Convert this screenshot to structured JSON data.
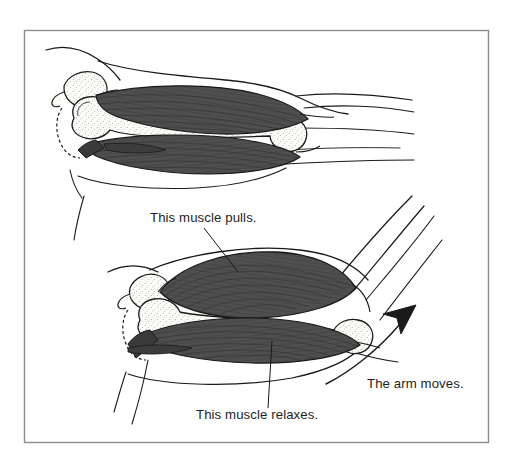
{
  "figure": {
    "domain": "anatomy-illustration",
    "title_visible": false,
    "background_color": "#ffffff",
    "frame": {
      "border_color": "#8a8a8a",
      "border_width_px": 1.5,
      "x": 24,
      "y": 30,
      "width": 465,
      "height": 413
    },
    "ink_color": "#1a1a1a",
    "muscle_fill_color": "#4f4f4f",
    "muscle_shade_dark": "#3a3a3a",
    "bone_fill_color": "#fbfbf8",
    "bone_stipple_color": "#555555",
    "skin_fill_color": "#ffffff"
  },
  "panels": [
    {
      "name": "upper-arm-extended",
      "description": "Arm extended, biceps relaxed and long, triceps contracted",
      "position": "top"
    },
    {
      "name": "lower-arm-flexed",
      "description": "Arm flexed, biceps bulging and contracted, triceps relaxed",
      "position": "bottom"
    }
  ],
  "labels": [
    {
      "id": "biceps-pulls",
      "text": "This muscle pulls.",
      "x": 150,
      "y": 222,
      "anchor": "start",
      "leader_to_x": 238,
      "leader_to_y": 272
    },
    {
      "id": "triceps-relaxes",
      "text": "This muscle relaxes.",
      "x": 196,
      "y": 419,
      "anchor": "start",
      "leader_to_x": 272,
      "leader_to_y": 341
    },
    {
      "id": "arm-moves",
      "text": "The arm moves.",
      "x": 367,
      "y": 388,
      "anchor": "start"
    }
  ],
  "annotations": {
    "motion_arrow": {
      "name": "arm-motion-arrow",
      "direction": "up-right",
      "curved": true,
      "tip_x": 416,
      "tip_y": 306
    }
  }
}
